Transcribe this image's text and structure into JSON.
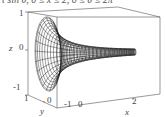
{
  "chart_data": {
    "type": "surface3d",
    "title": "t sin θ, 0 ≤ x ≤ 2, 0 ≤ θ ≤ 2π",
    "surface": {
      "description": "surface of revolution about x-axis: y = r(x)·cos θ, z = r(x)·sin θ",
      "x_range": [
        0,
        2
      ],
      "theta_range": [
        0,
        6.2832
      ],
      "radius_profile": "r(x) = 1 / (1 + 2.5x)^1.4 (horn shape, r(0)=1 tapering toward x=2)",
      "u_lines": 14,
      "v_lines": 22,
      "render": "wireframe"
    },
    "axes": {
      "x": {
        "label": "x",
        "range": [
          -1,
          2
        ],
        "ticks": [
          "0",
          "2"
        ]
      },
      "y": {
        "label": "y",
        "range": [
          -1,
          1
        ],
        "ticks": [
          "1",
          "0",
          "-1"
        ]
      },
      "z": {
        "label": "z",
        "range": [
          -1,
          1
        ],
        "ticks": [
          "1",
          "0",
          "-1"
        ]
      }
    },
    "box": true,
    "grid": false,
    "colors": {
      "mesh": "#222222",
      "box": "#555555"
    }
  }
}
